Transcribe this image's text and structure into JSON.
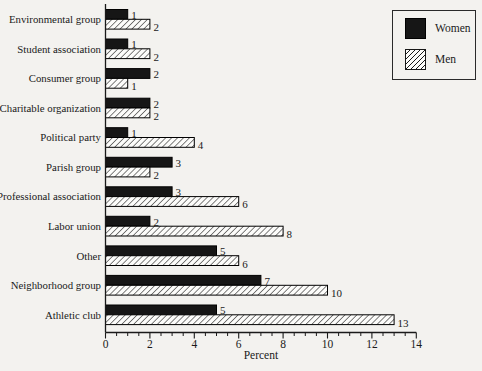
{
  "chart_data": {
    "type": "bar",
    "orientation": "horizontal",
    "title": "",
    "xlabel": "Percent",
    "ylabel": "",
    "xlim": [
      0,
      14
    ],
    "xticks": [
      0,
      2,
      4,
      6,
      8,
      10,
      12,
      14
    ],
    "minor_tick_step": 0.5,
    "grid": false,
    "bar_value_labels": true,
    "legend_position": "top-right",
    "categories": [
      "Environmental group",
      "Student association",
      "Consumer group",
      "Charitable organization",
      "Political party",
      "Parish group",
      "Professional association",
      "Labor union",
      "Other",
      "Neighborhood group",
      "Athletic club"
    ],
    "series": [
      {
        "name": "Women",
        "style": "solid",
        "color": "#161616",
        "values": [
          1,
          1,
          2,
          2,
          1,
          3,
          3,
          2,
          5,
          7,
          5
        ]
      },
      {
        "name": "Men",
        "style": "hatched",
        "hatch": "diagonal-forward",
        "color": "#1a1a1a",
        "fill_base": "#fcfcfa",
        "values": [
          2,
          2,
          1,
          2,
          4,
          2,
          6,
          8,
          6,
          10,
          13
        ]
      }
    ]
  },
  "colors": {
    "background": "#f3f2ef",
    "ink": "#1a1a1a",
    "bar_solid": "#161616",
    "hatch_base": "#fcfcfa"
  }
}
